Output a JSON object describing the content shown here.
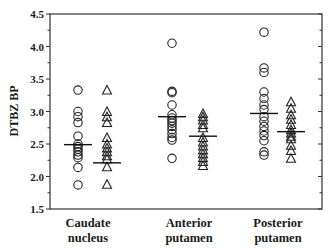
{
  "chart_data": {
    "type": "scatter",
    "subtype": "dot-plot with group means",
    "title": "",
    "xlabel": "",
    "ylabel": "DTBZ BP",
    "ylim": [
      1.5,
      4.5
    ],
    "yticks": [
      "1.5",
      "2.0",
      "2.5",
      "3.0",
      "3.5",
      "4.0",
      "4.5"
    ],
    "grid": false,
    "legend": null,
    "categories": [
      {
        "line1": "Caudate",
        "line2": "nucleus"
      },
      {
        "line1": "Anterior",
        "line2": "putamen"
      },
      {
        "line1": "Posterior",
        "line2": "putamen"
      }
    ],
    "series": [
      {
        "name": "circles",
        "marker": "circle",
        "groups": [
          {
            "category": "Caudate nucleus",
            "values": [
              3.33,
              3.0,
              2.92,
              2.83,
              2.62,
              2.5,
              2.46,
              2.42,
              2.38,
              2.33,
              2.29,
              2.14,
              1.87
            ],
            "mean": 2.49
          },
          {
            "category": "Anterior putamen",
            "values": [
              4.05,
              3.31,
              3.29,
              3.1,
              2.95,
              2.9,
              2.86,
              2.82,
              2.77,
              2.72,
              2.66,
              2.6,
              2.56,
              2.28
            ],
            "mean": 2.92
          },
          {
            "category": "Posterior putamen",
            "values": [
              4.22,
              3.67,
              3.6,
              3.3,
              3.2,
              3.1,
              3.03,
              2.92,
              2.85,
              2.77,
              2.7,
              2.63,
              2.55,
              2.38,
              2.33
            ],
            "mean": 2.97
          }
        ]
      },
      {
        "name": "triangles",
        "marker": "triangle",
        "groups": [
          {
            "category": "Caudate nucleus",
            "values": [
              3.33,
              3.0,
              2.92,
              2.83,
              2.6,
              2.5,
              2.44,
              2.38,
              2.32,
              2.27,
              2.15,
              1.88
            ],
            "mean": 2.21
          },
          {
            "category": "Anterior putamen",
            "values": [
              2.97,
              2.92,
              2.87,
              2.8,
              2.75,
              2.6,
              2.53,
              2.47,
              2.41,
              2.35,
              2.29,
              2.23,
              2.17
            ],
            "mean": 2.62
          },
          {
            "category": "Posterior putamen",
            "values": [
              3.15,
              3.05,
              2.95,
              2.88,
              2.8,
              2.72,
              2.67,
              2.62,
              2.58,
              2.48,
              2.4,
              2.28
            ],
            "mean": 2.69
          }
        ]
      }
    ]
  },
  "layout": {
    "plot_left": 50,
    "plot_right": 322,
    "plot_top": 14,
    "plot_bottom": 209,
    "group_x": {
      "circles": [
        78,
        172,
        264
      ],
      "triangles": [
        107,
        203,
        291
      ]
    },
    "category_label_x": [
      88,
      189,
      278
    ]
  }
}
